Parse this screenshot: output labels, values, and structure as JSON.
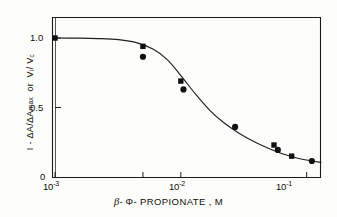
{
  "figure": {
    "title": "",
    "background_color": "#fdfdfb",
    "ink_color": "#111111"
  },
  "axes": {
    "x": {
      "label": "- PROPIONATE , M",
      "beta_symbol": "β",
      "phi_symbol": "Φ",
      "scale": "log",
      "range": [
        0.001,
        0.13
      ],
      "tick_values": [
        0.001,
        0.005,
        0.01,
        0.1
      ],
      "tick_labels": [
        "10",
        "",
        "10",
        "10"
      ],
      "tick_exponents": [
        "-3",
        "",
        "-2",
        "-1"
      ],
      "labeled_ticks": [
        {
          "value": 0.001,
          "mantissa": "10",
          "exponent": "-3"
        },
        {
          "value": 0.01,
          "mantissa": "10",
          "exponent": "-2"
        },
        {
          "value": 0.1,
          "mantissa": "10",
          "exponent": "-1"
        }
      ]
    },
    "y": {
      "label_part1": "I - ΔA/ΔA",
      "label_subscript": "max",
      "label_joiner": "or",
      "label_part2": "V",
      "label_part2_sub": "i",
      "label_part2_b": "/ V",
      "label_part2_b_sub": "c",
      "scale": "linear",
      "range": [
        0,
        1.12
      ],
      "tick_values": [
        0,
        0.5,
        1.0
      ],
      "tick_labels": [
        "0",
        "0.5",
        "1.0"
      ]
    }
  },
  "chart_data": {
    "type": "scatter",
    "title": "",
    "xlabel": "β-ΦPROPIONATE , M",
    "ylabel": "I - ΔA/ΔA max  or  Vi / Vc",
    "xscale": "log",
    "yscale": "linear",
    "xlim": [
      0.001,
      0.13
    ],
    "ylim": [
      0,
      1.12
    ],
    "xticks": [
      0.001,
      0.005,
      0.01,
      0.1
    ],
    "xticklabels": [
      "10^-3",
      "",
      "10^-2",
      "10^-1"
    ],
    "yticks": [
      0,
      0.5,
      1.0
    ],
    "yticklabels": [
      "0",
      "0.5",
      "1.0"
    ],
    "grid": false,
    "legend": "none",
    "series": [
      {
        "name": "square-series",
        "marker": "square",
        "color": "#111111",
        "points": [
          {
            "x": 0.001,
            "y": 1.0
          },
          {
            "x": 0.005,
            "y": 0.94
          },
          {
            "x": 0.01,
            "y": 0.69
          },
          {
            "x": 0.055,
            "y": 0.23
          },
          {
            "x": 0.076,
            "y": 0.15
          }
        ]
      },
      {
        "name": "circle-series",
        "marker": "circle",
        "color": "#111111",
        "points": [
          {
            "x": 0.005,
            "y": 0.865
          },
          {
            "x": 0.0105,
            "y": 0.63
          },
          {
            "x": 0.027,
            "y": 0.36
          },
          {
            "x": 0.059,
            "y": 0.195
          },
          {
            "x": 0.11,
            "y": 0.115
          }
        ]
      }
    ],
    "fitted_curve": {
      "name": "sigmoid-fit",
      "description": "sigmoidal inhibition curve",
      "midpoint_x": 0.0145,
      "top": 1.0,
      "bottom": 0.07,
      "points": [
        {
          "x": 0.001,
          "y": 1.0
        },
        {
          "x": 0.0015,
          "y": 0.999
        },
        {
          "x": 0.0022,
          "y": 0.996
        },
        {
          "x": 0.0032,
          "y": 0.988
        },
        {
          "x": 0.0045,
          "y": 0.965
        },
        {
          "x": 0.006,
          "y": 0.92
        },
        {
          "x": 0.0078,
          "y": 0.845
        },
        {
          "x": 0.01,
          "y": 0.73
        },
        {
          "x": 0.013,
          "y": 0.6
        },
        {
          "x": 0.017,
          "y": 0.48
        },
        {
          "x": 0.022,
          "y": 0.39
        },
        {
          "x": 0.029,
          "y": 0.315
        },
        {
          "x": 0.038,
          "y": 0.255
        },
        {
          "x": 0.05,
          "y": 0.205
        },
        {
          "x": 0.065,
          "y": 0.165
        },
        {
          "x": 0.085,
          "y": 0.135
        },
        {
          "x": 0.11,
          "y": 0.115
        },
        {
          "x": 0.13,
          "y": 0.105
        }
      ]
    }
  }
}
